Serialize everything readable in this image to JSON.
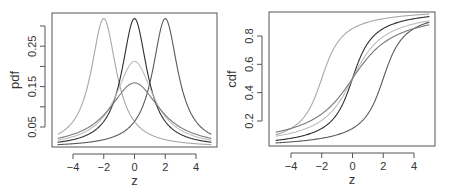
{
  "chart_data": [
    {
      "type": "line",
      "title": "",
      "xlabel": "z",
      "ylabel": "pdf",
      "xlim": [
        -5,
        5
      ],
      "ylim": [
        0.0,
        0.325
      ],
      "xticks": [
        -4,
        -2,
        0,
        2,
        4
      ],
      "xtick_labels": [
        "-4",
        "-2",
        "0",
        "2",
        "4"
      ],
      "yticks": [
        0.05,
        0.1,
        0.15,
        0.2,
        0.25,
        0.3
      ],
      "ytick_labels": [
        "0.05",
        "",
        "0.15",
        "",
        "0.25",
        ""
      ],
      "grid": false,
      "legend": null,
      "x": [
        -5,
        -4,
        -3,
        -2,
        -1,
        0,
        1,
        2,
        3,
        4,
        5
      ],
      "series": [
        {
          "name": "location -2, scale 1",
          "color": "#a8a8a8",
          "location": -2,
          "scale": 1,
          "values": [
            0.032,
            0.064,
            0.159,
            0.318,
            0.159,
            0.064,
            0.032,
            0.019,
            0.012,
            0.009,
            0.006
          ]
        },
        {
          "name": "location 0, scale 1",
          "color": "#2e2e2e",
          "location": 0,
          "scale": 1,
          "values": [
            0.012,
            0.019,
            0.032,
            0.064,
            0.159,
            0.318,
            0.159,
            0.064,
            0.032,
            0.019,
            0.012
          ]
        },
        {
          "name": "location 2, scale 1",
          "color": "#5a5a5a",
          "location": 2,
          "scale": 1,
          "values": [
            0.006,
            0.009,
            0.012,
            0.019,
            0.032,
            0.064,
            0.159,
            0.318,
            0.159,
            0.064,
            0.032
          ]
        },
        {
          "name": "location 0, scale 1.5",
          "color": "#bdbdbd",
          "location": 0,
          "scale": 1.5,
          "values": [
            0.018,
            0.026,
            0.042,
            0.076,
            0.147,
            0.212,
            0.147,
            0.076,
            0.042,
            0.026,
            0.018
          ]
        },
        {
          "name": "location 0, scale 2",
          "color": "#7a7a7a",
          "location": 0,
          "scale": 2,
          "values": [
            0.022,
            0.032,
            0.049,
            0.08,
            0.127,
            0.159,
            0.127,
            0.08,
            0.049,
            0.032,
            0.022
          ]
        }
      ]
    },
    {
      "type": "line",
      "title": "",
      "xlabel": "z",
      "ylabel": "cdf",
      "xlim": [
        -5,
        5
      ],
      "ylim": [
        0.04,
        0.97
      ],
      "xticks": [
        -4,
        -2,
        0,
        2,
        4
      ],
      "xtick_labels": [
        "-4",
        "-2",
        "0",
        "2",
        "4"
      ],
      "yticks": [
        0.2,
        0.4,
        0.6,
        0.8
      ],
      "ytick_labels": [
        "0.2",
        "0.4",
        "0.6",
        "0.8"
      ],
      "grid": false,
      "legend": null,
      "x": [
        -5,
        -4,
        -3,
        -2,
        -1,
        0,
        1,
        2,
        3,
        4,
        5
      ],
      "series": [
        {
          "name": "location -2, scale 1",
          "color": "#a8a8a8",
          "location": -2,
          "scale": 1,
          "values": [
            0.102,
            0.148,
            0.25,
            0.5,
            0.75,
            0.852,
            0.898,
            0.922,
            0.937,
            0.947,
            0.955
          ]
        },
        {
          "name": "location 0, scale 1",
          "color": "#2e2e2e",
          "location": 0,
          "scale": 1,
          "values": [
            0.063,
            0.078,
            0.102,
            0.148,
            0.25,
            0.5,
            0.75,
            0.852,
            0.898,
            0.922,
            0.937
          ]
        },
        {
          "name": "location 2, scale 1",
          "color": "#5a5a5a",
          "location": 2,
          "scale": 1,
          "values": [
            0.045,
            0.053,
            0.063,
            0.078,
            0.102,
            0.148,
            0.25,
            0.5,
            0.75,
            0.852,
            0.898
          ]
        },
        {
          "name": "location 0, scale 1.5",
          "color": "#bdbdbd",
          "location": 0,
          "scale": 1.5,
          "values": [
            0.093,
            0.114,
            0.148,
            0.205,
            0.313,
            0.5,
            0.687,
            0.795,
            0.852,
            0.886,
            0.907
          ]
        },
        {
          "name": "location 0, scale 2",
          "color": "#7a7a7a",
          "location": 0,
          "scale": 2,
          "values": [
            0.121,
            0.148,
            0.187,
            0.25,
            0.352,
            0.5,
            0.648,
            0.75,
            0.813,
            0.852,
            0.879
          ]
        }
      ]
    }
  ],
  "layout": {
    "panels": [
      {
        "box": {
          "x0": 52,
          "y0": 13,
          "x1": 217,
          "y1": 147
        },
        "x_map": {
          "v0": -4,
          "p0": 73,
          "v1": 4,
          "p1": 196
        },
        "y_map": {
          "v0": 0.05,
          "p0": 127,
          "v1": 0.3,
          "p1": 26
        },
        "curve_kind": "pdf"
      },
      {
        "box": {
          "x0": 269,
          "y0": 12,
          "x1": 435,
          "y1": 146
        },
        "x_map": {
          "v0": -4,
          "p0": 291,
          "v1": 4,
          "p1": 414
        },
        "y_map": {
          "v0": 0.2,
          "p0": 121,
          "v1": 0.8,
          "p1": 36
        },
        "curve_kind": "cdf"
      }
    ]
  }
}
